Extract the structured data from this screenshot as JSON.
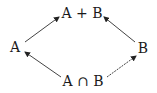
{
  "diagram": {
    "nodes": {
      "top": {
        "label": "A + B"
      },
      "left": {
        "label": "A"
      },
      "right": {
        "label": "B"
      },
      "bottom": {
        "label": "A ∩ B"
      }
    },
    "edges": [
      {
        "from": "left",
        "to": "top"
      },
      {
        "from": "right",
        "to": "top"
      },
      {
        "from": "bottom",
        "to": "left"
      },
      {
        "from": "bottom",
        "to": "right"
      }
    ],
    "colors": {
      "line": "#333333",
      "text": "#1a1a1a",
      "background": "#ffffff"
    }
  }
}
